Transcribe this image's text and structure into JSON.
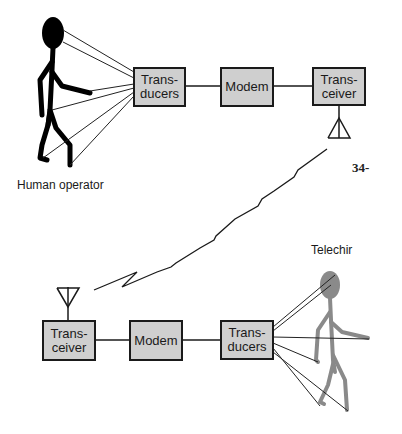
{
  "top_chain": {
    "transducers": "Trans-\nducers",
    "modem": "Modem",
    "transceiver": "Trans-\nceiver"
  },
  "bottom_chain": {
    "transceiver": "Trans-\nceiver",
    "modem": "Modem",
    "transducers": "Trans-\nducers"
  },
  "labels": {
    "human_operator": "Human operator",
    "telechir": "Telechir",
    "page_number": "34-"
  },
  "colors": {
    "box_fill": "#cfcfcf",
    "line": "#1a1a1a",
    "human_figure": "#000000",
    "telechir_figure": "#8a8a8a"
  }
}
